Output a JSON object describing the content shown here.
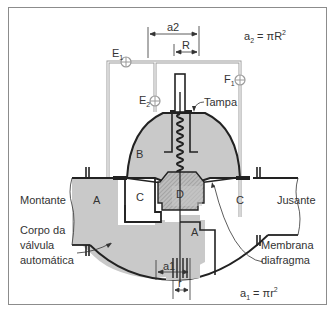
{
  "diagram": {
    "colors": {
      "frame": "#8c8c8c",
      "fluid_fill": "#c9c9c9",
      "hatch_fill": "#b5b5b5",
      "outline": "#222222",
      "pipe_line": "#9a9a9a",
      "text": "#333333",
      "background": "#ffffff"
    },
    "formulas": {
      "a2": {
        "lhs": "a",
        "lhs_sub": "2",
        "rhs": " = πR",
        "rhs_sup": "2"
      },
      "a1": {
        "lhs": "a",
        "lhs_sub": "1",
        "rhs": " = πr",
        "rhs_sup": "2"
      }
    },
    "dimensions": {
      "a2": "a2",
      "R": "R",
      "a1": "a1",
      "r": "r"
    },
    "valves": {
      "E1": {
        "letter": "E",
        "sub": "1"
      },
      "E2": {
        "letter": "E",
        "sub": "2"
      },
      "F1": {
        "letter": "F",
        "sub": "1"
      }
    },
    "chambers": {
      "A_left": "A",
      "A_bottom": "A",
      "B": "B",
      "C_left": "C",
      "C_right": "C",
      "D": "D"
    },
    "callouts": {
      "tampa": "Tampa",
      "montante": "Montante",
      "jusante": "Jusante",
      "corpo_line1": "Corpo da",
      "corpo_line2": "válvula",
      "corpo_line3": "automática",
      "membrana_line1": "Membrana",
      "membrana_line2": "diafragma"
    }
  }
}
